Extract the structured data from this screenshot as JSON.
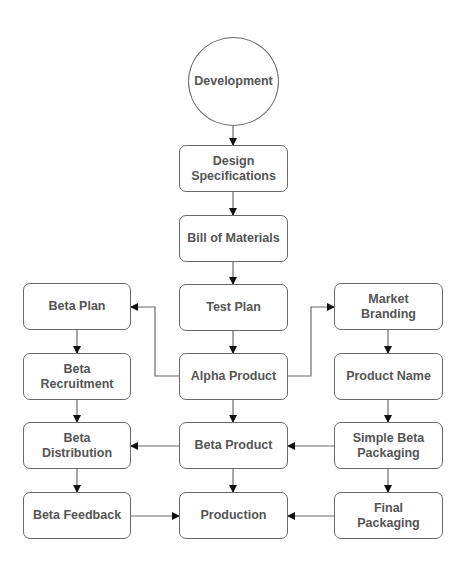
{
  "diagram": {
    "type": "flowchart",
    "colors": {
      "border": "#6a6a6a",
      "text": "#555555",
      "connector": "#6a6a6a",
      "arrowhead": "#111111",
      "background": "#ffffff"
    },
    "nodes": [
      {
        "id": "development",
        "label": "Development",
        "shape": "circle",
        "x": 188,
        "y": 37,
        "w": 91,
        "h": 89
      },
      {
        "id": "design_specifications",
        "label": "Design\nSpecifications",
        "shape": "rounded-rect",
        "x": 179,
        "y": 145,
        "w": 109,
        "h": 47
      },
      {
        "id": "bill_of_materials",
        "label": "Bill of Materials",
        "shape": "rounded-rect",
        "x": 179,
        "y": 215,
        "w": 109,
        "h": 47
      },
      {
        "id": "test_plan",
        "label": "Test Plan",
        "shape": "rounded-rect",
        "x": 179,
        "y": 284,
        "w": 109,
        "h": 47
      },
      {
        "id": "beta_plan",
        "label": "Beta Plan",
        "shape": "rounded-rect",
        "x": 23,
        "y": 283,
        "w": 108,
        "h": 47
      },
      {
        "id": "market_branding",
        "label": "Market\nBranding",
        "shape": "rounded-rect",
        "x": 334,
        "y": 283,
        "w": 109,
        "h": 47
      },
      {
        "id": "beta_recruitment",
        "label": "Beta\nRecruitment",
        "shape": "rounded-rect",
        "x": 23,
        "y": 353,
        "w": 108,
        "h": 47
      },
      {
        "id": "alpha_product",
        "label": "Alpha Product",
        "shape": "rounded-rect",
        "x": 179,
        "y": 353,
        "w": 109,
        "h": 47
      },
      {
        "id": "product_name",
        "label": "Product Name",
        "shape": "rounded-rect",
        "x": 334,
        "y": 353,
        "w": 109,
        "h": 47
      },
      {
        "id": "beta_distribution",
        "label": "Beta\nDistribution",
        "shape": "rounded-rect",
        "x": 23,
        "y": 422,
        "w": 108,
        "h": 47
      },
      {
        "id": "beta_product",
        "label": "Beta Product",
        "shape": "rounded-rect",
        "x": 179,
        "y": 422,
        "w": 109,
        "h": 47
      },
      {
        "id": "simple_beta_packaging",
        "label": "Simple Beta\nPackaging",
        "shape": "rounded-rect",
        "x": 334,
        "y": 422,
        "w": 109,
        "h": 47
      },
      {
        "id": "beta_feedback",
        "label": "Beta Feedback",
        "shape": "rounded-rect",
        "x": 23,
        "y": 492,
        "w": 108,
        "h": 47
      },
      {
        "id": "production",
        "label": "Production",
        "shape": "rounded-rect",
        "x": 179,
        "y": 492,
        "w": 109,
        "h": 47
      },
      {
        "id": "final_packaging",
        "label": "Final\nPackaging",
        "shape": "rounded-rect",
        "x": 334,
        "y": 492,
        "w": 109,
        "h": 47
      }
    ],
    "edges": [
      {
        "from": "development",
        "to": "design_specifications",
        "points": [
          [
            233,
            126
          ],
          [
            233,
            145
          ]
        ]
      },
      {
        "from": "design_specifications",
        "to": "bill_of_materials",
        "points": [
          [
            233,
            192
          ],
          [
            233,
            215
          ]
        ]
      },
      {
        "from": "bill_of_materials",
        "to": "test_plan",
        "points": [
          [
            233,
            262
          ],
          [
            233,
            284
          ]
        ]
      },
      {
        "from": "test_plan",
        "to": "alpha_product",
        "points": [
          [
            233,
            331
          ],
          [
            233,
            353
          ]
        ]
      },
      {
        "from": "alpha_product",
        "to": "beta_plan",
        "points": [
          [
            179,
            376
          ],
          [
            155,
            376
          ],
          [
            155,
            307
          ],
          [
            131,
            307
          ]
        ]
      },
      {
        "from": "alpha_product",
        "to": "market_branding",
        "points": [
          [
            288,
            376
          ],
          [
            311,
            376
          ],
          [
            311,
            307
          ],
          [
            334,
            307
          ]
        ]
      },
      {
        "from": "beta_plan",
        "to": "beta_recruitment",
        "points": [
          [
            77,
            330
          ],
          [
            77,
            353
          ]
        ]
      },
      {
        "from": "market_branding",
        "to": "product_name",
        "points": [
          [
            388,
            330
          ],
          [
            388,
            353
          ]
        ]
      },
      {
        "from": "alpha_product",
        "to": "beta_product",
        "points": [
          [
            233,
            400
          ],
          [
            233,
            422
          ]
        ]
      },
      {
        "from": "beta_recruitment",
        "to": "beta_distribution",
        "points": [
          [
            77,
            400
          ],
          [
            77,
            422
          ]
        ]
      },
      {
        "from": "product_name",
        "to": "simple_beta_packaging",
        "points": [
          [
            388,
            400
          ],
          [
            388,
            422
          ]
        ]
      },
      {
        "from": "beta_product",
        "to": "beta_distribution",
        "points": [
          [
            179,
            446
          ],
          [
            131,
            446
          ]
        ]
      },
      {
        "from": "simple_beta_packaging",
        "to": "beta_product",
        "points": [
          [
            334,
            446
          ],
          [
            288,
            446
          ]
        ]
      },
      {
        "from": "beta_distribution",
        "to": "beta_feedback",
        "points": [
          [
            77,
            469
          ],
          [
            77,
            492
          ]
        ]
      },
      {
        "from": "beta_product",
        "to": "production",
        "points": [
          [
            233,
            469
          ],
          [
            233,
            492
          ]
        ]
      },
      {
        "from": "simple_beta_packaging",
        "to": "final_packaging",
        "points": [
          [
            388,
            469
          ],
          [
            388,
            492
          ]
        ]
      },
      {
        "from": "beta_feedback",
        "to": "production",
        "points": [
          [
            131,
            516
          ],
          [
            179,
            516
          ]
        ]
      },
      {
        "from": "final_packaging",
        "to": "production",
        "points": [
          [
            334,
            516
          ],
          [
            288,
            516
          ]
        ]
      }
    ]
  }
}
